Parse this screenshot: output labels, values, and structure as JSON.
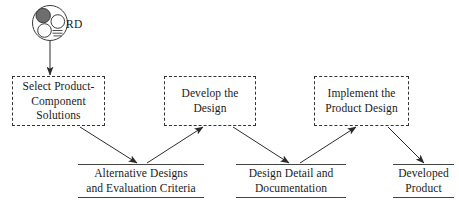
{
  "diagram": {
    "type": "process-flow",
    "background_color": "#ffffff",
    "line_color": "#333333",
    "text_color": "#1a1a1a"
  },
  "role": {
    "label": "RD",
    "icon_name": "role-group-icon",
    "icon_fill_color": "#6e6e6e",
    "icon_stroke_color": "#3a3a3a"
  },
  "processes": [
    {
      "id": "select-product-component-solutions",
      "label": "Select Product-\nComponent\nSolutions",
      "line1": "Select Product-",
      "line2": "Component",
      "line3": "Solutions"
    },
    {
      "id": "develop-the-design",
      "label": "Develop the\nDesign",
      "line1": "Develop the",
      "line2": "Design",
      "line3": ""
    },
    {
      "id": "implement-the-product-design",
      "label": "Implement the\nProduct Design",
      "line1": "Implement the",
      "line2": "Product Design",
      "line3": ""
    }
  ],
  "artifacts": [
    {
      "id": "alternative-designs-and-evaluation-criteria",
      "line1": "Alternative Designs",
      "line2": "and Evaluation Criteria"
    },
    {
      "id": "design-detail-and-documentation",
      "line1": "Design Detail and",
      "line2": "Documentation"
    },
    {
      "id": "developed-product",
      "line1": "Developed",
      "line2": "Product"
    }
  ],
  "connectors": [
    {
      "id": "role-to-process-1",
      "from": "role-icon",
      "to": "select-product-component-solutions",
      "style": "solid-arrow"
    },
    {
      "id": "process-1-to-artifact-1",
      "from": "select-product-component-solutions",
      "to": "alternative-designs-and-evaluation-criteria",
      "style": "solid-arrow"
    },
    {
      "id": "artifact-1-to-process-2",
      "from": "alternative-designs-and-evaluation-criteria",
      "to": "develop-the-design",
      "style": "solid-arrow"
    },
    {
      "id": "process-2-to-artifact-2",
      "from": "develop-the-design",
      "to": "design-detail-and-documentation",
      "style": "solid-arrow"
    },
    {
      "id": "artifact-2-to-process-3",
      "from": "design-detail-and-documentation",
      "to": "implement-the-product-design",
      "style": "solid-arrow"
    },
    {
      "id": "process-3-to-artifact-3",
      "from": "implement-the-product-design",
      "to": "developed-product",
      "style": "solid-arrow"
    }
  ]
}
